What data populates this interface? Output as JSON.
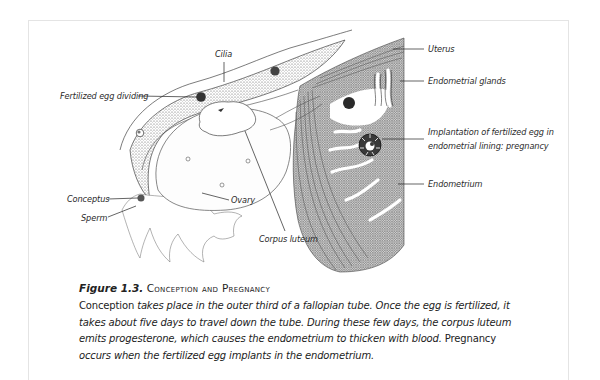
{
  "figure": {
    "number": "Figure 1.3.",
    "title": "Conception and Pregnancy",
    "labels": {
      "cilia": "Cilia",
      "fertilized_egg_dividing": "Fertilized egg dividing",
      "uterus": "Uterus",
      "endometrial_glands": "Endometrial glands",
      "implantation_line1": "Implantation of fertilized egg in",
      "implantation_line2": "endometrial lining: pregnancy",
      "endometrium": "Endometrium",
      "conceptus": "Conceptus",
      "sperm": "Sperm",
      "ovary": "Ovary",
      "corpus_luteum": "Corpus luteum"
    },
    "caption": {
      "seg1": "Conception ",
      "seg2": "takes place in the outer third of a fallopian tube. Once the egg is fertilized, it takes about five days to travel down the tube. During these few days, the corpus luteum emits progesterone, which causes the endometrium to thicken with blood. ",
      "seg3": "Pregnancy ",
      "seg4": "occurs when the fertilized egg implants in the endometrium."
    }
  }
}
